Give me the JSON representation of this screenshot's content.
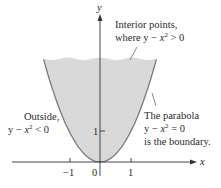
{
  "figure": {
    "axis_labels": {
      "x": "x",
      "y": "y"
    },
    "x_ticks": [
      {
        "value": -1,
        "label": "−1"
      },
      {
        "value": 0,
        "label": "0"
      },
      {
        "value": 1,
        "label": "1"
      }
    ],
    "y_ticks": [
      {
        "value": 1,
        "label": "1"
      }
    ],
    "annotations": {
      "interior": {
        "line1": "Interior points,",
        "line2_prefix": "where y − ",
        "line2_var": "x",
        "line2_exp": "2",
        "line2_suffix": " > 0"
      },
      "outside": {
        "line1": "Outside,",
        "line2_prefix": "y − ",
        "line2_var": "x",
        "line2_exp": "2",
        "line2_suffix": " < 0"
      },
      "boundary": {
        "line1": "The parabola",
        "line2_prefix": "y − ",
        "line2_var": "x",
        "line2_exp": "2",
        "line2_suffix": " = 0",
        "line3": "is the boundary."
      }
    },
    "colors": {
      "region_fill": "#d9d9d9",
      "curve": "#7a7a7a",
      "axis": "#333333",
      "text": "#2a2a2a"
    },
    "curve": "y = x^2",
    "region": "y - x^2 > 0"
  }
}
